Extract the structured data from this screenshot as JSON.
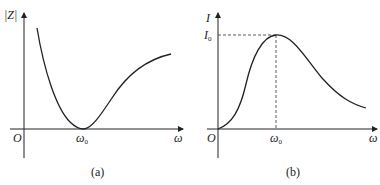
{
  "header_fragment": "truncated line of text at top edge (unreadable)",
  "panels": [
    {
      "id": "a",
      "caption": "(a)",
      "y_axis_label": "|Z|",
      "x_axis_label": "ω",
      "origin_label": "O",
      "tick_label": "ω",
      "tick_sub": "0",
      "curve_description": "Impedance magnitude vs angular frequency: decreasing to minimum at ω0 then rising"
    },
    {
      "id": "b",
      "caption": "(b)",
      "y_axis_label": "I",
      "x_axis_label": "ω",
      "origin_label": "O",
      "tick_label": "ω",
      "tick_sub": "0",
      "peak_label": "I",
      "peak_sub": "0",
      "curve_description": "Current vs angular frequency: resonance peak I0 at ω0"
    }
  ],
  "colors": {
    "line": "#222222",
    "background": "#ffffff"
  }
}
